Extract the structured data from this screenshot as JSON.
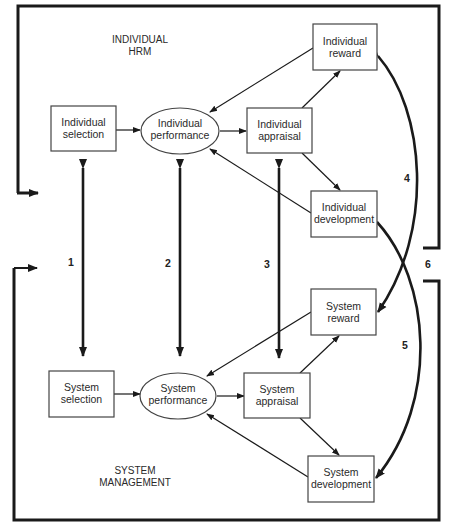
{
  "diagram": {
    "colors": {
      "line": "#1a1a1a",
      "box_stroke": "#444444",
      "background": "#ffffff",
      "text": "#2a2a2a"
    },
    "sections": {
      "individual": {
        "line1": "INDIVIDUAL",
        "line2": "HRM"
      },
      "system": {
        "line1": "SYSTEM",
        "line2": "MANAGEMENT"
      }
    },
    "nodes": {
      "individual_selection": {
        "line1": "Individual",
        "line2": "selection",
        "shape": "rect"
      },
      "individual_performance": {
        "line1": "Individual",
        "line2": "performance",
        "shape": "ellipse"
      },
      "individual_appraisal": {
        "line1": "Individual",
        "line2": "appraisal",
        "shape": "rect"
      },
      "individual_reward": {
        "line1": "Individual",
        "line2": "reward",
        "shape": "rect"
      },
      "individual_development": {
        "line1": "Individual",
        "line2": "development",
        "shape": "rect"
      },
      "system_selection": {
        "line1": "System",
        "line2": "selection",
        "shape": "rect"
      },
      "system_performance": {
        "line1": "System",
        "line2": "performance",
        "shape": "ellipse"
      },
      "system_appraisal": {
        "line1": "System",
        "line2": "appraisal",
        "shape": "rect"
      },
      "system_reward": {
        "line1": "System",
        "line2": "reward",
        "shape": "rect"
      },
      "system_development": {
        "line1": "System",
        "line2": "development",
        "shape": "rect"
      }
    },
    "link_numbers": [
      "1",
      "2",
      "3",
      "4",
      "5",
      "6"
    ],
    "edges": [
      {
        "from": "Individual selection",
        "to": "Individual performance"
      },
      {
        "from": "Individual performance",
        "to": "Individual appraisal"
      },
      {
        "from": "Individual appraisal",
        "to": "Individual reward"
      },
      {
        "from": "Individual appraisal",
        "to": "Individual development"
      },
      {
        "from": "Individual reward",
        "to": "Individual performance"
      },
      {
        "from": "Individual development",
        "to": "Individual performance"
      },
      {
        "from": "System selection",
        "to": "System performance"
      },
      {
        "from": "System performance",
        "to": "System appraisal"
      },
      {
        "from": "System appraisal",
        "to": "System reward"
      },
      {
        "from": "System appraisal",
        "to": "System development"
      },
      {
        "from": "System reward",
        "to": "System performance"
      },
      {
        "from": "System development",
        "to": "System performance"
      },
      {
        "label": "1",
        "between": [
          "Individual selection",
          "System selection"
        ],
        "bidirectional": true
      },
      {
        "label": "2",
        "between": [
          "Individual performance",
          "System performance"
        ],
        "bidirectional": true
      },
      {
        "label": "3",
        "between": [
          "Individual appraisal",
          "System appraisal"
        ],
        "bidirectional": true
      },
      {
        "label": "4",
        "between": [
          "Individual reward",
          "System reward"
        ],
        "bidirectional": true
      },
      {
        "label": "5",
        "between": [
          "Individual development",
          "System development"
        ],
        "bidirectional": true
      },
      {
        "label": "6",
        "between": [
          "Individual HRM frame",
          "System management frame"
        ],
        "bidirectional": true
      }
    ]
  }
}
